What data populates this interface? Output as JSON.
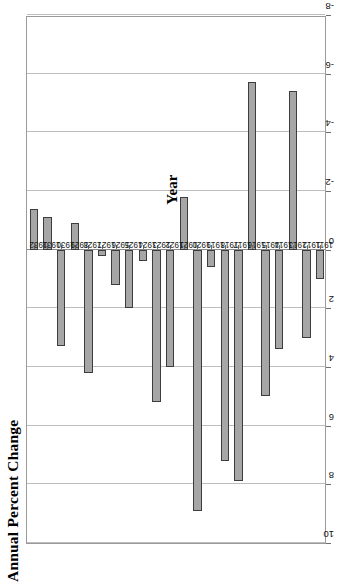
{
  "chart_data": {
    "type": "bar",
    "title": "Annual Percent Change",
    "xlabel": "Year",
    "ylabel": "Annual Percent Change",
    "orientation": "vertical-bars-rendered-rotated-90ccw",
    "grid": true,
    "legend": false,
    "ylim": [
      -8,
      10
    ],
    "yticks": [
      10,
      8,
      6,
      4,
      2,
      0,
      -2,
      -4,
      -6,
      -8
    ],
    "ytick_labels": [
      "10",
      "8",
      "6",
      "4",
      "2",
      "0",
      "-2",
      "-4",
      "-6",
      "-8"
    ],
    "categories": [
      "1911",
      "1912",
      "1913",
      "1914",
      "1915",
      "1916",
      "1917",
      "1918",
      "1919",
      "1920",
      "1921",
      "1922",
      "1923",
      "1924",
      "1925",
      "1926",
      "1927",
      "1928",
      "1929",
      "1930",
      "1931",
      "1932"
    ],
    "values": [
      1.0,
      3.0,
      -5.4,
      3.4,
      5.0,
      -5.7,
      7.9,
      7.2,
      0.6,
      8.9,
      -1.8,
      4.0,
      5.2,
      0.4,
      2.0,
      1.2,
      0.2,
      4.2,
      -0.9,
      3.3,
      -1.1,
      -1.4
    ],
    "series": [
      {
        "name": "Annual Percent Change",
        "values": [
          1.0,
          3.0,
          -5.4,
          3.4,
          5.0,
          -5.7,
          7.9,
          7.2,
          0.6,
          8.9,
          -1.8,
          4.0,
          5.2,
          0.4,
          2.0,
          1.2,
          0.2,
          4.2,
          -0.9,
          3.3,
          -1.1,
          -1.4
        ]
      }
    ],
    "colors": {
      "bar_fill": "#a6a6a6",
      "bar_edge": "#3d3d3d",
      "gridline": "#bdbdbd",
      "axis": "#9a9a9a",
      "text": "#000000",
      "plot_background": "#ffffff"
    }
  }
}
